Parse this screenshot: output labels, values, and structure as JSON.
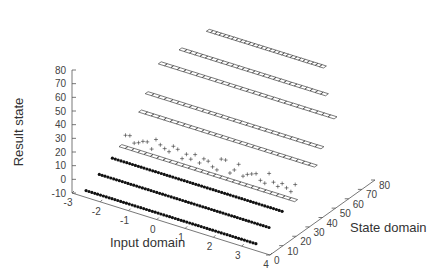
{
  "chart_data": {
    "type": "scatter",
    "projection": "3d",
    "title": "",
    "xlabel": "Input domain",
    "ylabel": "State domain",
    "zlabel": "Result state",
    "xlim": [
      -3,
      4
    ],
    "ylim": [
      0,
      80
    ],
    "zlim": [
      -10,
      80
    ],
    "x_ticks": [
      "-3",
      "-2",
      "-1",
      "0",
      "1",
      "2",
      "3",
      "4"
    ],
    "y_ticks": [
      "0",
      "10",
      "20",
      "30",
      "40",
      "50",
      "60",
      "70",
      "80"
    ],
    "z_ticks": [
      "80",
      "70",
      "60",
      "50",
      "40",
      "30",
      "20",
      "10",
      "0",
      "-10"
    ],
    "grid": false,
    "legend": "none",
    "series": [
      {
        "name": "result-state-rows",
        "marker": "mixed: filled dots, open rectangles, plus signs",
        "rows": [
          {
            "z": -5,
            "y": 0,
            "x_range": [
              -2.5,
              3.5
            ],
            "marker": "dot"
          },
          {
            "z": 0,
            "y": 10,
            "x_range": [
              -2.5,
              3.5
            ],
            "marker": "dot"
          },
          {
            "z": 5,
            "y": 20,
            "x_range": [
              -2.5,
              3.5
            ],
            "marker": "dot"
          },
          {
            "z": 10,
            "y": 25,
            "x_range": [
              -2.5,
              3.5
            ],
            "marker": "box"
          },
          {
            "z": 15,
            "y": 30,
            "x_range": [
              -2.5,
              3.5
            ],
            "marker": "plus"
          },
          {
            "z": 25,
            "y": 40,
            "x_range": [
              -2.5,
              3.5
            ],
            "marker": "box"
          },
          {
            "z": 35,
            "y": 45,
            "x_range": [
              -2.5,
              3.5
            ],
            "marker": "box"
          },
          {
            "z": 50,
            "y": 55,
            "x_range": [
              -2.5,
              3.5
            ],
            "marker": "box"
          },
          {
            "z": 60,
            "y": 60,
            "x_range": [
              -2,
              3
            ],
            "marker": "box"
          },
          {
            "z": 70,
            "y": 70,
            "x_range": [
              -1.5,
              2.5
            ],
            "marker": "box"
          }
        ]
      }
    ]
  }
}
